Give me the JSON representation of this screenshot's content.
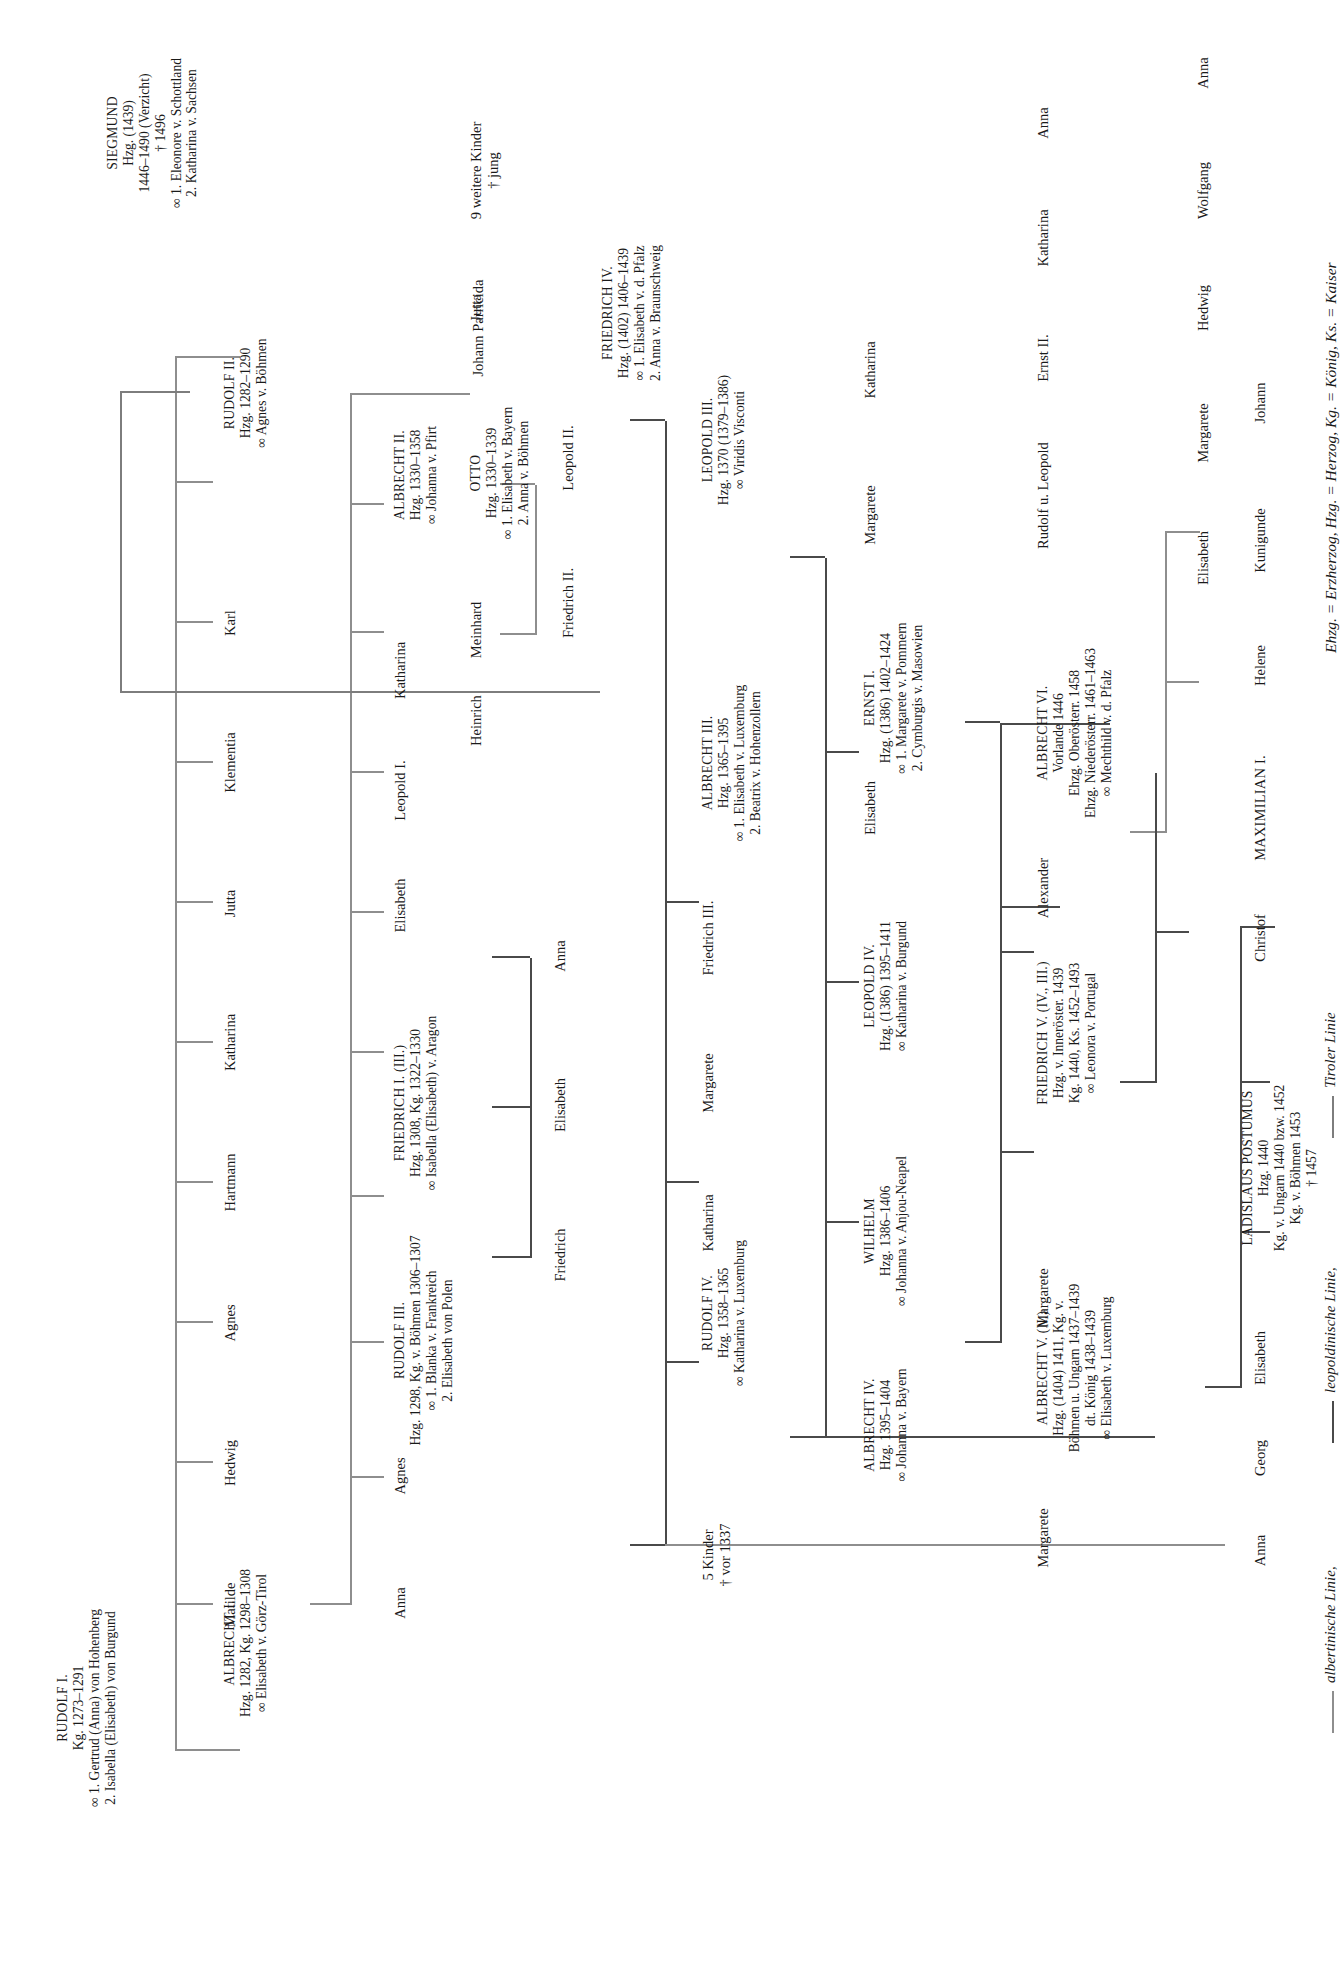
{
  "meta": {
    "abbreviations": "Ehzg. = Erzherzog, Hzg. = Herzog, Kg. = König, Ks. = Kaiser"
  },
  "legend": {
    "items": [
      {
        "label": "albertinische Linie,",
        "color": "#8e8e8e"
      },
      {
        "label": "leopoldinische Linie,",
        "color": "#4a4a4a"
      },
      {
        "label": "Tiroler Linie",
        "color": "#7d7d7d"
      }
    ]
  },
  "nodes": {
    "rudolf1": {
      "l1": "RUDOLF I.",
      "l2": "Kg. 1273–1291",
      "l3": "∞ 1. Gertrud (Anna) von Hohenberg",
      "l4": "2. Isabella (Elisabeth) von Burgund"
    },
    "albrecht1": {
      "l1": "ALBRECHT I.",
      "l2": "Hzg. 1282, Kg. 1298–1308",
      "l3": "∞ Elisabeth v. Görz-Tirol"
    },
    "matilde": {
      "l1": "Matilde"
    },
    "hedwig1": {
      "l1": "Hedwig"
    },
    "agnes1": {
      "l1": "Agnes"
    },
    "hartmann": {
      "l1": "Hartmann"
    },
    "katharina1": {
      "l1": "Katharina"
    },
    "jutta1": {
      "l1": "Jutta"
    },
    "klementia": {
      "l1": "Klementia"
    },
    "karl": {
      "l1": "Karl"
    },
    "anna1": {
      "l1": "Anna"
    },
    "agnes2": {
      "l1": "Agnes"
    },
    "rudolf3": {
      "l1": "RUDOLF III.",
      "l2": "Hzg. 1298, Kg. v. Böhmen 1306–1307",
      "l3": "∞ 1. Blanka v. Frankreich",
      "l4": "2. Elisabeth von Polen"
    },
    "friedrich1": {
      "l1": "FRIEDRICH I. (III.)",
      "l2": "Hzg. 1308, Kg. 1322–1330",
      "l3": "∞ Isabella (Elisabeth) v. Aragon"
    },
    "elisabeth1": {
      "l1": "Elisabeth"
    },
    "leopold1": {
      "l1": "Leopold I."
    },
    "katharina2": {
      "l1": "Katharina"
    },
    "albrecht2": {
      "l1": "ALBRECHT II.",
      "l2": "Hzg. 1330–1358",
      "l3": "∞ Johanna v. Pfirt"
    },
    "heinrich": {
      "l1": "Heinrich"
    },
    "meinhard": {
      "l1": "Meinhard"
    },
    "otto": {
      "l1": "OTTO",
      "l2": "Hzg. 1330–1339",
      "l3": "∞ 1. Elisabeth v. Bayern",
      "l4": "2. Anna v. Böhmen"
    },
    "jutta2": {
      "l1": "Jutta"
    },
    "neun_kinder": {
      "l1": "9 weitere Kinder",
      "l2": "† jung"
    },
    "rudolf2": {
      "l1": "RUDOLF II.",
      "l2": "Hzg. 1282–1290",
      "l3": "∞ Agnes v. Böhmen"
    },
    "johann_parricida": {
      "l1": "Johann Parricida"
    },
    "friedrich2b": {
      "l1": "Friedrich II."
    },
    "leopold2b": {
      "l1": "Leopold II."
    },
    "friedrich_k": {
      "l1": "Friedrich"
    },
    "elisabeth_k": {
      "l1": "Elisabeth"
    },
    "anna_k": {
      "l1": "Anna"
    },
    "fuenf_kinder": {
      "l1": "5 Kinder",
      "l2": "† vor 1337"
    },
    "rudolf4": {
      "l1": "RUDOLF IV.",
      "l2": "Hzg. 1358–1365",
      "l3": "∞ Katharina v. Luxemburg"
    },
    "katharina3": {
      "l1": "Katharina"
    },
    "margarete1": {
      "l1": "Margarete"
    },
    "friedrich3": {
      "l1": "Friedrich III."
    },
    "albrecht3": {
      "l1": "ALBRECHT III.",
      "l2": "Hzg. 1365–1395",
      "l3": "∞ 1. Elisabeth v. Luxemburg",
      "l4": "2. Beatrix v. Hohenzollern"
    },
    "leopold3": {
      "l1": "LEOPOLD III.",
      "l2": "Hzg. 1370 (1379–1386)",
      "l3": "∞ Viridis Visconti"
    },
    "albrecht4": {
      "l1": "ALBRECHT IV.",
      "l2": "Hzg. 1395–1404",
      "l3": "∞ Johanna v. Bayern"
    },
    "wilhelm": {
      "l1": "WILHELM",
      "l2": "Hzg. 1386–1406",
      "l3": "∞ Johanna v. Anjou-Neapel"
    },
    "leopold4": {
      "l1": "LEOPOLD IV.",
      "l2": "Hzg. (1386) 1395–1411",
      "l3": "∞ Katharina v. Burgund"
    },
    "ernst1": {
      "l1": "ERNST I.",
      "l2": "Hzg. (1386) 1402–1424",
      "l3": "∞ 1. Margarete v. Pommern",
      "l4": "2. Cymburgis v. Masowien"
    },
    "elisabeth2": {
      "l1": "Elisabeth"
    },
    "margarete2": {
      "l1": "Margarete"
    },
    "katharina4": {
      "l1": "Katharina"
    },
    "friedrich4": {
      "l1": "FRIEDRICH IV.",
      "l2": "Hzg. (1402) 1406–1439",
      "l3": "∞ 1. Elisabeth v. d. Pfalz",
      "l4": "2. Anna v. Braunschweig"
    },
    "albrecht5": {
      "l1": "ALBRECHT V. (II.)",
      "l2": "Hzg. (1404) 1411, Kg. v.",
      "l3": "Böhmen u. Ungarn 1437–1439",
      "l4": "dt. König 1438–1439",
      "l5": "∞ Elisabeth v. Luxemburg"
    },
    "margarete3": {
      "l1": "Margarete"
    },
    "friedrich5": {
      "l1": "FRIEDRICH V. (IV., III.)",
      "l2": "Hzg. v. Inneröster. 1439",
      "l3": "Kg. 1440, Ks. 1452–1493",
      "l4": "∞ Leonora v. Portugal"
    },
    "alexander": {
      "l1": "Alexander"
    },
    "albrecht6": {
      "l1": "ALBRECHT VI.",
      "l2": "Vorlande 1446",
      "l3": "Ehzg. Oberösterr. 1458",
      "l4": "Ehzg. Niederösterr. 1461–1463",
      "l5": "∞ Mechthild v. d. Pfalz"
    },
    "rudolf_leopold": {
      "l1": "Rudolf u. Leopold"
    },
    "ernst2": {
      "l1": "Ernst II."
    },
    "katharina5": {
      "l1": "Katharina"
    },
    "anna2": {
      "l1": "Anna"
    },
    "siegmund": {
      "l1": "SIEGMUND",
      "l2": "Hzg. (1439)",
      "l3": "1446–1490 (Verzicht)",
      "l4": "† 1496",
      "l5": "∞ 1. Eleonore v. Schottland",
      "l6": "2. Katharina v. Sachsen"
    },
    "elisabeth3": {
      "l1": "Elisabeth"
    },
    "margarete4": {
      "l1": "Margarete"
    },
    "hedwig2": {
      "l1": "Hedwig"
    },
    "wolfgang": {
      "l1": "Wolfgang"
    },
    "anna3": {
      "l1": "Anna"
    },
    "georg": {
      "l1": "Georg"
    },
    "elisabeth4": {
      "l1": "Elisabeth"
    },
    "ladislaus": {
      "l1": "LADISLAUS POSTUMUS",
      "l2": "Hzg. 1440",
      "l3": "Kg. v. Ungarn 1440 bzw. 1452",
      "l4": "Kg. v. Böhmen 1453",
      "l5": "† 1457"
    },
    "christof": {
      "l1": "Christof"
    },
    "maximilian": {
      "l1": "MAXIMILIAN I."
    },
    "helene": {
      "l1": "Helene"
    },
    "kunigunde": {
      "l1": "Kunigunde"
    },
    "johann": {
      "l1": "Johann"
    },
    "margarete5": {
      "l1": "Margarete"
    }
  }
}
